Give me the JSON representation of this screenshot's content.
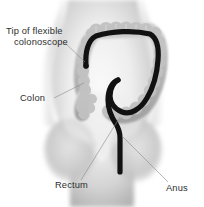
{
  "figure": {
    "background_color": "#ffffff",
    "body_tone_light": "#f2f2f2",
    "body_tone_mid": "#d6d6d6",
    "body_tone_dark": "#9a9a9a",
    "colon_tone": "#bdbdbd",
    "scope_color": "#111111",
    "leader_color": "#8a8a8a",
    "text_color": "#2e2e2e"
  },
  "labels": [
    {
      "id": "scope-tip",
      "name": "tip-of-flexible-colonoscope",
      "lines": [
        "Tip of flexible",
        "colonoscope"
      ],
      "line1": "Tip of flexible",
      "line2": "colonoscope",
      "text_x": 6,
      "text_y": 34,
      "leader": {
        "x1": 64,
        "y1": 42,
        "x2": 85,
        "y2": 62
      }
    },
    {
      "id": "colon",
      "name": "colon",
      "lines": [
        "Colon"
      ],
      "line1": "Colon",
      "text_x": 20,
      "text_y": 101,
      "leader": {
        "x1": 54,
        "y1": 98,
        "x2": 84,
        "y2": 83
      }
    },
    {
      "id": "rectum",
      "name": "rectum",
      "lines": [
        "Rectum"
      ],
      "line1": "Rectum",
      "text_x": 55,
      "text_y": 188,
      "leader": {
        "x1": 81,
        "y1": 180,
        "x2": 120,
        "y2": 117
      }
    },
    {
      "id": "anus",
      "name": "anus",
      "lines": [
        "Anus"
      ],
      "line1": "Anus",
      "text_x": 166,
      "text_y": 191,
      "leader": {
        "x1": 168,
        "y1": 182,
        "x2": 122,
        "y2": 136
      }
    }
  ],
  "anatomy": {
    "torso": "human lower torso, front view, grayscale airbrush shading",
    "colon": "large intestine with haustral segmentation, inverted-U shape",
    "colonoscope": "flexible black tube entering at anus, through rectum and sigmoid, up descending colon, across transverse colon, tip ending in ascending colon"
  }
}
